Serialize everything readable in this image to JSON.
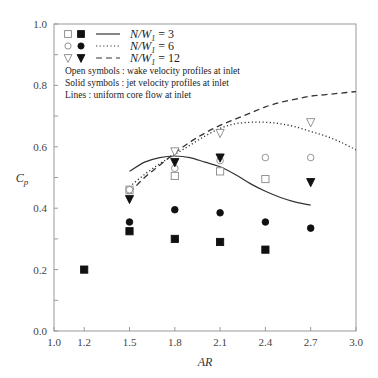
{
  "chart_data": {
    "type": "scatter",
    "title": "",
    "xlabel": "AR",
    "ylabel": "C_p",
    "xlim": [
      1.0,
      3.0
    ],
    "ylim": [
      0.0,
      1.0
    ],
    "x_ticks": [
      1.0,
      1.2,
      1.5,
      1.8,
      2.1,
      2.4,
      2.7,
      3.0
    ],
    "x_tick_labels": [
      "1.0",
      "1.2",
      "1.5",
      "1.8",
      "2.1",
      "2.4",
      "2.7",
      "3.0"
    ],
    "y_ticks": [
      0.0,
      0.2,
      0.4,
      0.6,
      0.8,
      1.0
    ],
    "y_tick_labels": [
      "0.0",
      "0.2",
      "0.4",
      "0.6",
      "0.8",
      "1.0"
    ],
    "grid": false,
    "legend_position": "upper left",
    "legend": [
      {
        "open": "square",
        "filled": "square",
        "line": "solid",
        "label_prefix": "N/W",
        "label_sub": "1",
        "label_suffix": " = 3"
      },
      {
        "open": "circle",
        "filled": "circle",
        "line": "dotted",
        "label_prefix": "N/W",
        "label_sub": "1",
        "label_suffix": " = 6"
      },
      {
        "open": "triangle-down",
        "filled": "triangle-down",
        "line": "dashed",
        "label_prefix": "N/W",
        "label_sub": "1",
        "label_suffix": " = 12"
      }
    ],
    "notes": [
      "Open symbols : wake velocity profiles at inlet",
      "Solid symbols : jet velocity profiles at inlet",
      "Lines : uniform core flow at inlet"
    ],
    "series": [
      {
        "name": "N/W1=3 wake (open square)",
        "marker": "square",
        "filled": false,
        "x": [
          1.5,
          1.8,
          2.1,
          2.4
        ],
        "y": [
          0.46,
          0.505,
          0.52,
          0.495
        ]
      },
      {
        "name": "N/W1=6 wake (open circle)",
        "marker": "circle",
        "filled": false,
        "x": [
          1.5,
          1.8,
          2.1,
          2.4,
          2.7
        ],
        "y": [
          0.46,
          0.53,
          0.555,
          0.565,
          0.565
        ]
      },
      {
        "name": "N/W1=12 wake (open triangle)",
        "marker": "triangle-down",
        "filled": false,
        "x": [
          1.8,
          2.1,
          2.7
        ],
        "y": [
          0.585,
          0.645,
          0.68
        ]
      },
      {
        "name": "N/W1=3 jet (filled square)",
        "marker": "square",
        "filled": true,
        "x": [
          1.2,
          1.5,
          1.8,
          2.1,
          2.4
        ],
        "y": [
          0.2,
          0.325,
          0.3,
          0.29,
          0.265
        ]
      },
      {
        "name": "N/W1=6 jet (filled circle)",
        "marker": "circle",
        "filled": true,
        "x": [
          1.5,
          1.8,
          2.1,
          2.4,
          2.7
        ],
        "y": [
          0.355,
          0.395,
          0.385,
          0.355,
          0.335
        ]
      },
      {
        "name": "N/W1=12 jet (filled triangle)",
        "marker": "triangle-down",
        "filled": true,
        "x": [
          1.5,
          1.8,
          2.1,
          2.7
        ],
        "y": [
          0.43,
          0.55,
          0.565,
          0.485
        ]
      },
      {
        "name": "N/W1=3 uniform core (solid line)",
        "line": "solid",
        "x": [
          1.5,
          1.6,
          1.7,
          1.8,
          1.9,
          2.0,
          2.1,
          2.2,
          2.3,
          2.4,
          2.5,
          2.6,
          2.7
        ],
        "y": [
          0.52,
          0.55,
          0.565,
          0.57,
          0.565,
          0.55,
          0.535,
          0.51,
          0.48,
          0.455,
          0.435,
          0.42,
          0.41
        ]
      },
      {
        "name": "N/W1=6 uniform core (dotted line)",
        "line": "dotted",
        "x": [
          1.5,
          1.6,
          1.7,
          1.8,
          1.9,
          2.0,
          2.1,
          2.2,
          2.3,
          2.4,
          2.5,
          2.6,
          2.7,
          2.8,
          2.9,
          3.0
        ],
        "y": [
          0.47,
          0.51,
          0.545,
          0.575,
          0.605,
          0.635,
          0.66,
          0.675,
          0.68,
          0.68,
          0.675,
          0.665,
          0.65,
          0.635,
          0.615,
          0.59
        ]
      },
      {
        "name": "N/W1=12 uniform core (dashed line)",
        "line": "dashed",
        "x": [
          1.5,
          1.6,
          1.7,
          1.8,
          1.9,
          2.0,
          2.1,
          2.2,
          2.3,
          2.4,
          2.5,
          2.6,
          2.7,
          2.8,
          2.9,
          3.0
        ],
        "y": [
          0.45,
          0.5,
          0.54,
          0.58,
          0.615,
          0.645,
          0.67,
          0.69,
          0.71,
          0.73,
          0.745,
          0.755,
          0.765,
          0.77,
          0.775,
          0.78
        ]
      }
    ]
  }
}
